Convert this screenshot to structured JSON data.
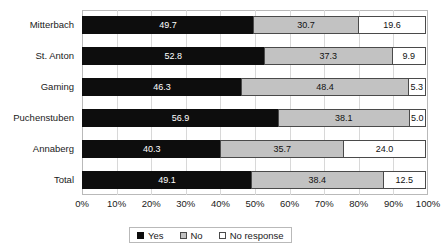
{
  "chart_data": {
    "type": "bar",
    "orientation": "horizontal",
    "stacked": true,
    "stacked_percent": true,
    "title": "",
    "xlabel": "",
    "ylabel": "",
    "xlim": [
      0,
      100
    ],
    "grid": true,
    "legend_position": "bottom",
    "categories": [
      "Mitterbach",
      "St. Anton",
      "Gaming",
      "Puchenstuben",
      "Annaberg",
      "Total"
    ],
    "xtick_labels": [
      "0%",
      "10%",
      "20%",
      "30%",
      "40%",
      "50%",
      "60%",
      "70%",
      "80%",
      "90%",
      "100%"
    ],
    "xtick_values": [
      0,
      10,
      20,
      30,
      40,
      50,
      60,
      70,
      80,
      90,
      100
    ],
    "series": [
      {
        "name": "Yes",
        "color": "#0d0d0d",
        "values": [
          49.7,
          52.8,
          46.3,
          56.9,
          40.3,
          49.1
        ],
        "labels": [
          "49.7",
          "52.8",
          "46.3",
          "56.9",
          "40.3",
          "49.1"
        ]
      },
      {
        "name": "No",
        "color": "#c2c2c2",
        "values": [
          30.7,
          37.3,
          48.4,
          38.1,
          35.7,
          38.4
        ],
        "labels": [
          "30.7",
          "37.3",
          "48.4",
          "38.1",
          "35.7",
          "38.4"
        ]
      },
      {
        "name": "No response",
        "color": "#ffffff",
        "values": [
          19.6,
          9.9,
          5.3,
          5.0,
          24.0,
          12.5
        ],
        "labels": [
          "19.6",
          "9.9",
          "5.3",
          "5.0",
          "24.0",
          "12.5"
        ]
      }
    ]
  },
  "legend": {
    "items": [
      {
        "label": "Yes",
        "swatch": "legend-swatch-yes"
      },
      {
        "label": "No",
        "swatch": "legend-swatch-no"
      },
      {
        "label": "No response",
        "swatch": "legend-swatch-no-response"
      }
    ]
  }
}
